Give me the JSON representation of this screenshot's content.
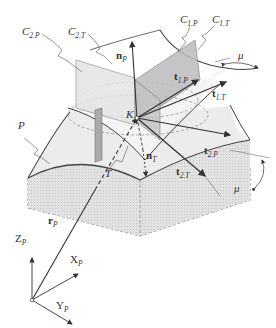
{
  "diagram": {
    "type": "geometry-figure",
    "labels": {
      "C2P": {
        "main": "C",
        "sub": "2.P"
      },
      "C2T": {
        "main": "C",
        "sub": "2.T"
      },
      "C1P": {
        "main": "C",
        "sub": "1.P"
      },
      "C1T": {
        "main": "C",
        "sub": "1.T"
      },
      "nP": {
        "main": "n",
        "sub": "P"
      },
      "t1P": {
        "main": "t",
        "sub": "1.P"
      },
      "t1T": {
        "main": "t",
        "sub": "1.T"
      },
      "mu_top": "μ",
      "P": "P",
      "K": "K",
      "nT": {
        "main": "n",
        "sub": "T"
      },
      "t2P": {
        "main": "t",
        "sub": "2.P"
      },
      "t2T": {
        "main": "t",
        "sub": "2.T"
      },
      "T": "T",
      "mu_bottom": "μ",
      "rP": {
        "main": "r",
        "sub": "P"
      },
      "ZP": {
        "main": "Z",
        "sub": "P"
      },
      "XP": {
        "main": "X",
        "sub": "P"
      },
      "YP": {
        "main": "Y",
        "sub": "P"
      }
    },
    "colors": {
      "line": "#444444",
      "shade_light": "#e6e6e6",
      "shade_dark": "#bdbdbd",
      "shade_block": "#dcdcdc"
    }
  }
}
